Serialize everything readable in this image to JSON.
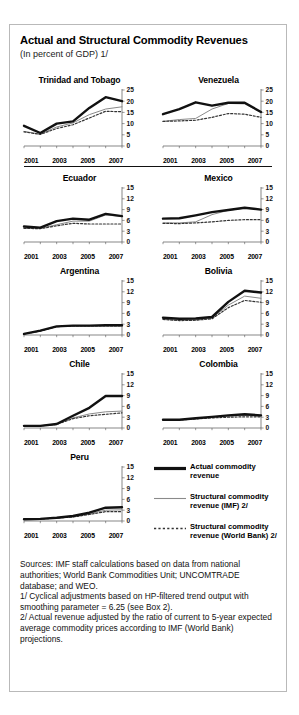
{
  "header": {
    "title": "Actual and Structural Commodity Revenues",
    "subtitle": "(In percent of GDP) 1/"
  },
  "legend": [
    {
      "label": "Actual commodity revenue",
      "style": "thick-black-line"
    },
    {
      "label": "Structural commodity revenue (IMF) 2/",
      "style": "thin-gray-line"
    },
    {
      "label": "Structural commodity revenue (World Bank) 2/",
      "style": "dotted-line"
    }
  ],
  "notes": [
    "Sources:  IMF staff calculations based on data from national authorities; World Bank Commodities Unit; UNCOMTRADE database; and WEO.",
    "1/ Cyclical adjustments based on HP-filtered trend output with smoothing parameter = 6.25 (see Box 2).",
    "2/ Actual revenue adjusted by the ratio of current to 5-year expected average commodity prices according to IMF (World Bank) projections."
  ],
  "colors": {
    "actual": "#111111",
    "imf": "#8a8a8a",
    "worldbank": "#333333",
    "border": "#b9b9b9",
    "axis": "#555555"
  },
  "chart_data": [
    {
      "type": "line",
      "title": "Trinidad and Tobago",
      "xlabel": "",
      "ylabel": "",
      "x": [
        2001,
        2002,
        2003,
        2004,
        2005,
        2006,
        2007
      ],
      "xticklabels": [
        "2001",
        "2003",
        "2005",
        "2007"
      ],
      "ylim": [
        0,
        25
      ],
      "yticks": [
        0,
        5,
        10,
        15,
        20,
        25
      ],
      "grid": false,
      "legend_position": "external",
      "series": [
        {
          "name": "Actual commodity revenue",
          "values": [
            9.0,
            5.8,
            10.0,
            11.0,
            17.0,
            21.8,
            20.0
          ]
        },
        {
          "name": "Structural commodity revenue (IMF) 2/",
          "values": [
            6.5,
            5.3,
            8.5,
            10.3,
            14.0,
            16.5,
            17.5
          ]
        },
        {
          "name": "Structural commodity revenue (World Bank) 2/",
          "values": [
            6.3,
            5.2,
            7.8,
            9.5,
            12.5,
            15.5,
            15.3
          ]
        }
      ]
    },
    {
      "type": "line",
      "title": "Venezuela",
      "xlabel": "",
      "ylabel": "",
      "x": [
        2001,
        2002,
        2003,
        2004,
        2005,
        2006,
        2007
      ],
      "xticklabels": [
        "2001",
        "2003",
        "2005",
        "2007"
      ],
      "ylim": [
        0,
        25
      ],
      "yticks": [
        0,
        5,
        10,
        15,
        20,
        25
      ],
      "grid": false,
      "legend_position": "external",
      "series": [
        {
          "name": "Actual commodity revenue",
          "values": [
            14.2,
            16.5,
            19.5,
            18.0,
            19.3,
            19.3,
            15.2
          ]
        },
        {
          "name": "Structural commodity revenue (IMF) 2/",
          "values": [
            11.0,
            11.8,
            12.3,
            16.5,
            19.0,
            18.8,
            15.0
          ]
        },
        {
          "name": "Structural commodity revenue (World Bank) 2/",
          "values": [
            11.0,
            11.2,
            11.5,
            12.8,
            14.5,
            14.2,
            12.8
          ]
        }
      ]
    },
    {
      "type": "line",
      "title": "Ecuador",
      "xlabel": "",
      "ylabel": "",
      "x": [
        2001,
        2002,
        2003,
        2004,
        2005,
        2006,
        2007
      ],
      "xticklabels": [
        "2001",
        "2003",
        "2005",
        "2007"
      ],
      "ylim": [
        0,
        15
      ],
      "yticks": [
        0,
        3,
        6,
        9,
        12,
        15
      ],
      "grid": false,
      "legend_position": "external",
      "series": [
        {
          "name": "Actual commodity revenue",
          "values": [
            4.3,
            4.0,
            5.8,
            6.5,
            6.2,
            7.8,
            7.2
          ]
        },
        {
          "name": "Structural commodity revenue (IMF) 2/",
          "values": [
            3.8,
            3.8,
            4.8,
            5.8,
            5.8,
            7.5,
            7.1
          ]
        },
        {
          "name": "Structural commodity revenue (World Bank) 2/",
          "values": [
            3.8,
            3.7,
            4.5,
            5.2,
            5.0,
            5.0,
            5.0
          ]
        }
      ]
    },
    {
      "type": "line",
      "title": "Mexico",
      "xlabel": "",
      "ylabel": "",
      "x": [
        2001,
        2002,
        2003,
        2004,
        2005,
        2006,
        2007
      ],
      "xticklabels": [
        "2001",
        "2003",
        "2005",
        "2007"
      ],
      "ylim": [
        0,
        15
      ],
      "yticks": [
        0,
        3,
        6,
        9,
        12,
        15
      ],
      "grid": false,
      "legend_position": "external",
      "series": [
        {
          "name": "Actual commodity revenue",
          "values": [
            6.5,
            6.6,
            7.4,
            8.3,
            8.9,
            9.5,
            9.0
          ]
        },
        {
          "name": "Structural commodity revenue (IMF) 2/",
          "values": [
            5.3,
            5.3,
            5.6,
            7.6,
            8.8,
            9.4,
            9.0
          ]
        },
        {
          "name": "Structural commodity revenue (World Bank) 2/",
          "values": [
            5.2,
            5.1,
            5.3,
            5.6,
            6.0,
            6.2,
            6.2
          ]
        }
      ]
    },
    {
      "type": "line",
      "title": "Argentina",
      "xlabel": "",
      "ylabel": "",
      "x": [
        2001,
        2002,
        2003,
        2004,
        2005,
        2006,
        2007
      ],
      "xticklabels": [
        "2001",
        "2003",
        "2005",
        "2007"
      ],
      "ylim": [
        0,
        15
      ],
      "yticks": [
        0,
        3,
        6,
        9,
        12,
        15
      ],
      "grid": false,
      "legend_position": "external",
      "series": [
        {
          "name": "Actual commodity revenue",
          "values": [
            0.3,
            1.2,
            2.4,
            2.6,
            2.6,
            2.7,
            2.7
          ]
        },
        {
          "name": "Structural commodity revenue (IMF) 2/",
          "values": [
            0.3,
            1.1,
            2.3,
            2.5,
            2.5,
            2.6,
            2.6
          ]
        },
        {
          "name": "Structural commodity revenue (World Bank) 2/",
          "values": [
            0.3,
            1.1,
            2.3,
            2.5,
            2.5,
            2.5,
            2.5
          ]
        }
      ]
    },
    {
      "type": "line",
      "title": "Bolivia",
      "xlabel": "",
      "ylabel": "",
      "x": [
        2001,
        2002,
        2003,
        2004,
        2005,
        2006,
        2007
      ],
      "xticklabels": [
        "2001",
        "2003",
        "2005",
        "2007"
      ],
      "ylim": [
        0,
        15
      ],
      "yticks": [
        0,
        3,
        6,
        9,
        12,
        15
      ],
      "grid": false,
      "legend_position": "external",
      "series": [
        {
          "name": "Actual commodity revenue",
          "values": [
            4.8,
            4.5,
            4.6,
            5.0,
            9.2,
            12.3,
            11.8
          ]
        },
        {
          "name": "Structural commodity revenue (IMF) 2/",
          "values": [
            4.4,
            4.1,
            4.2,
            4.7,
            8.3,
            10.8,
            10.2
          ]
        },
        {
          "name": "Structural commodity revenue (World Bank) 2/",
          "values": [
            4.3,
            4.0,
            4.1,
            4.5,
            7.6,
            9.6,
            9.1
          ]
        }
      ]
    },
    {
      "type": "line",
      "title": "Chile",
      "xlabel": "",
      "ylabel": "",
      "x": [
        2001,
        2002,
        2003,
        2004,
        2005,
        2006,
        2007
      ],
      "xticklabels": [
        "2001",
        "2003",
        "2005",
        "2007"
      ],
      "ylim": [
        0,
        15
      ],
      "yticks": [
        0,
        3,
        6,
        9,
        12,
        15
      ],
      "grid": false,
      "legend_position": "external",
      "series": [
        {
          "name": "Actual commodity revenue",
          "values": [
            0.6,
            0.6,
            1.1,
            3.4,
            5.6,
            8.9,
            8.9
          ]
        },
        {
          "name": "Structural commodity revenue (IMF) 2/",
          "values": [
            0.6,
            0.6,
            1.0,
            2.8,
            3.9,
            4.5,
            4.7
          ]
        },
        {
          "name": "Structural commodity revenue (World Bank) 2/",
          "values": [
            0.6,
            0.6,
            1.0,
            2.6,
            3.4,
            3.8,
            4.2
          ]
        }
      ]
    },
    {
      "type": "line",
      "title": "Colombia",
      "xlabel": "",
      "ylabel": "",
      "x": [
        2001,
        2002,
        2003,
        2004,
        2005,
        2006,
        2007
      ],
      "xticklabels": [
        "2001",
        "2003",
        "2005",
        "2007"
      ],
      "ylim": [
        0,
        15
      ],
      "yticks": [
        0,
        3,
        6,
        9,
        12,
        15
      ],
      "grid": false,
      "legend_position": "external",
      "series": [
        {
          "name": "Actual commodity revenue",
          "values": [
            2.3,
            2.3,
            2.7,
            3.1,
            3.5,
            3.8,
            3.5
          ]
        },
        {
          "name": "Structural commodity revenue (IMF) 2/",
          "values": [
            2.3,
            2.3,
            2.6,
            3.0,
            3.3,
            3.5,
            3.4
          ]
        },
        {
          "name": "Structural commodity revenue (World Bank) 2/",
          "values": [
            2.3,
            2.2,
            2.5,
            2.8,
            3.0,
            3.1,
            3.1
          ]
        }
      ]
    },
    {
      "type": "line",
      "title": "Peru",
      "xlabel": "",
      "ylabel": "",
      "x": [
        2001,
        2002,
        2003,
        2004,
        2005,
        2006,
        2007
      ],
      "xticklabels": [
        "2001",
        "2003",
        "2005",
        "2007"
      ],
      "ylim": [
        0,
        15
      ],
      "yticks": [
        0,
        3,
        6,
        9,
        12,
        15
      ],
      "grid": false,
      "legend_position": "external",
      "series": [
        {
          "name": "Actual commodity revenue",
          "values": [
            0.5,
            0.6,
            0.9,
            1.4,
            2.3,
            3.7,
            3.8
          ]
        },
        {
          "name": "Structural commodity revenue (IMF) 2/",
          "values": [
            0.5,
            0.6,
            0.8,
            1.2,
            2.0,
            3.0,
            3.1
          ]
        },
        {
          "name": "Structural commodity revenue (World Bank) 2/",
          "values": [
            0.5,
            0.5,
            0.8,
            1.1,
            1.8,
            2.6,
            2.6
          ]
        }
      ]
    }
  ]
}
